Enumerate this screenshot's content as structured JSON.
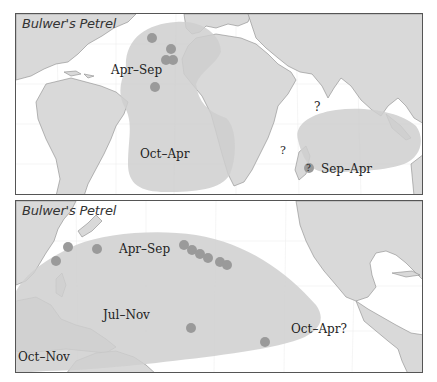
{
  "figure": {
    "species": "Bulwer's Petrel",
    "colors": {
      "land": "#d9d9d9",
      "ocean": "#ffffff",
      "range": "#cfcfcf",
      "point": "#9a9a9a",
      "coast": "#888888",
      "frame": "#555555",
      "text": "#222222"
    }
  },
  "panels": [
    {
      "id": "atlantic-indian",
      "title": "Bulwer's Petrel",
      "range_labels": [
        "Apr–Sep",
        "Oct–Apr",
        "Sep–Apr"
      ],
      "question_marks": [
        "?",
        "?",
        "?"
      ],
      "point_count": 5
    },
    {
      "id": "pacific",
      "title": "Bulwer's Petrel",
      "range_labels": [
        "Apr–Sep",
        "Jul–Nov",
        "Oct–Nov",
        "Oct–Apr?"
      ],
      "point_count": 11
    }
  ]
}
